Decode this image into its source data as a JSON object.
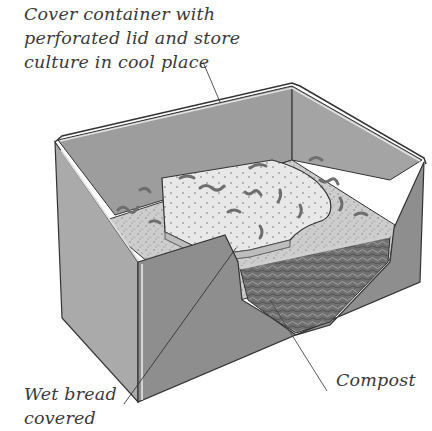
{
  "figure": {
    "labels": {
      "cover": "Cover container with\nperforated lid and store\nculture in cool place",
      "bread": "Wet bread\ncovered",
      "compost": "Compost"
    }
  },
  "colors": {
    "background": "#ffffff",
    "box_outer_left": "#a9a9a9",
    "box_outer_front": "#8f8f8f",
    "box_inner_back": "#9a9a9a",
    "rim": "#d8d8d8",
    "surface": "#cfcfcf",
    "bread": "#e6e6e6",
    "compost": "#6f6f6f",
    "worm": "#777777",
    "outline": "#333333",
    "text": "#3a3a3a"
  }
}
